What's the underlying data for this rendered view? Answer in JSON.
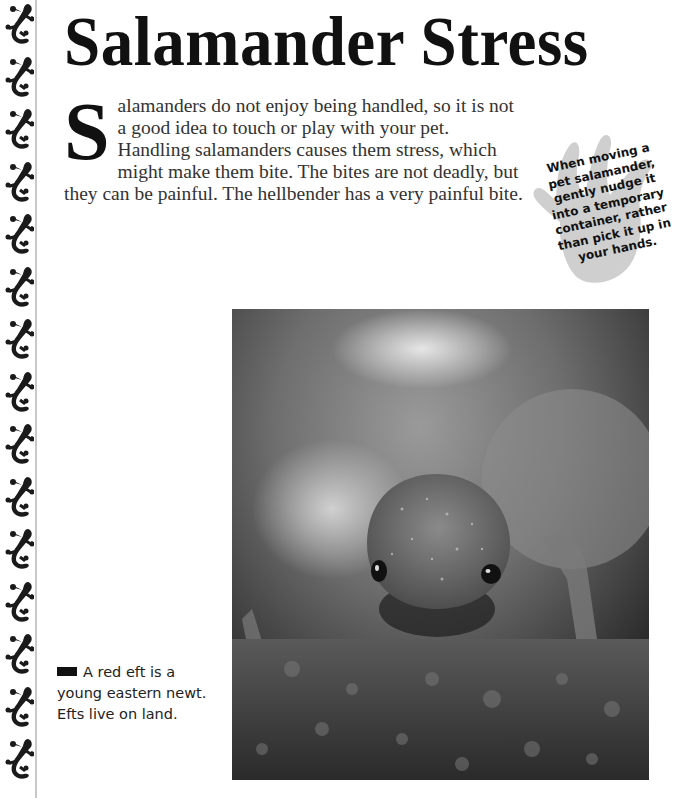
{
  "page": {
    "title": "Salamander Stress",
    "dropcap_letter": "S",
    "body_text": "alamanders do not enjoy being handled, so it is not a good idea to touch or play with your pet. Handling salamanders causes them stress, which might make them bite. The bites are not deadly, but they can be painful. The hellbender has a very painful bite.",
    "tip": {
      "icon": "handprint-icon",
      "text": "When moving a\npet salamander,\ngently nudge it\ninto a temporary\ncontainer, rather\nthan pick it up in\nyour hands."
    },
    "photo": {
      "subject": "red eft (young eastern newt) on moss",
      "style": "black-and-white photograph"
    },
    "caption": "A red eft is a young eastern newt. Efts live on land.",
    "side_strip": {
      "icon": "salamander-icon",
      "count": 15
    },
    "colors": {
      "title": "#111111",
      "body": "#333333",
      "hand": "#cfcfcf",
      "rule": "#c8c8c8"
    }
  }
}
